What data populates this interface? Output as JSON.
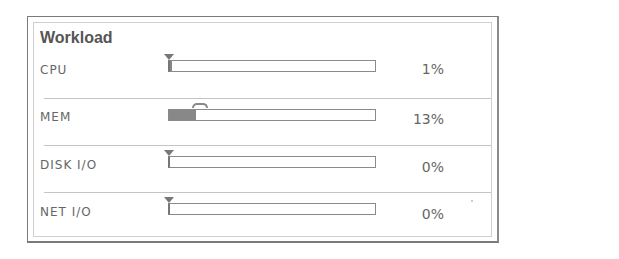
{
  "panel": {
    "title": "Workload",
    "rows": [
      {
        "label": "CPU",
        "value_pct": 1,
        "value_text": "1%",
        "marker": "triangle"
      },
      {
        "label": "MEM",
        "value_pct": 13,
        "value_text": "13%",
        "marker": "peak-arc"
      },
      {
        "label": "DISK I/O",
        "value_pct": 0,
        "value_text": "0%",
        "marker": "triangle"
      },
      {
        "label": "NET I/O",
        "value_pct": 0,
        "value_text": "0%",
        "marker": "triangle"
      }
    ]
  },
  "colors": {
    "bar_fill": "#888888",
    "bar_border": "#8a8a8a",
    "separator": "#c4c4c4",
    "text": "#666666"
  }
}
